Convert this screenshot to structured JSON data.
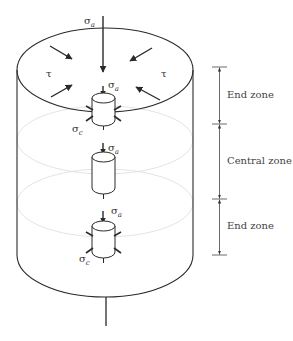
{
  "figure": {
    "labels": {
      "sigma_a": "σ",
      "sigma_a_sub": "a",
      "sigma_c": "σ",
      "sigma_c_sub": "c",
      "tau": "τ"
    },
    "zones": [
      {
        "label": "End zone",
        "from_y": 67,
        "to_y": 124
      },
      {
        "label": "Central zone",
        "from_y": 124,
        "to_y": 199
      },
      {
        "label": "End zone",
        "from_y": 199,
        "to_y": 255
      }
    ],
    "elements": [
      {
        "name": "end-element-top",
        "stresses": [
          "σa",
          "σc"
        ]
      },
      {
        "name": "central-element",
        "stresses": [
          "σa"
        ]
      },
      {
        "name": "end-element-bottom",
        "stresses": [
          "σa",
          "σc"
        ]
      }
    ],
    "colors": {
      "line": "#2a2a2a",
      "faint": "#d8d8d8",
      "dim": "#555555"
    }
  }
}
